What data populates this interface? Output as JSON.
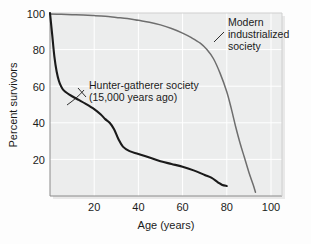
{
  "chart_data": {
    "type": "line",
    "title": "",
    "xlabel": "Age (years)",
    "ylabel": "Percent survivors",
    "xlim": [
      0,
      105
    ],
    "ylim": [
      0,
      100
    ],
    "xticks": [
      20,
      40,
      60,
      80,
      100
    ],
    "yticks": [
      20,
      40,
      60,
      80,
      100
    ],
    "grid": true,
    "legend_position": "annotations-on-plot",
    "series": [
      {
        "name": "Hunter-gatherer society (15,000 years ago)",
        "color": "#1a1a1a",
        "line_width": 2.1,
        "x": [
          0,
          1,
          2,
          3,
          4,
          5,
          6,
          8,
          10,
          13,
          16,
          20,
          23,
          25,
          27,
          29,
          31,
          33,
          36,
          40,
          45,
          50,
          55,
          60,
          65,
          70,
          73,
          76,
          78,
          80
        ],
        "y": [
          100,
          88,
          76,
          68,
          63,
          60,
          58,
          56,
          54.5,
          52.5,
          50.5,
          47.5,
          44.5,
          42,
          40,
          36.5,
          31,
          27,
          24.5,
          23,
          21,
          19,
          17.5,
          16,
          14,
          11.5,
          10,
          7.5,
          6,
          5.5
        ]
      },
      {
        "name": "Modern industrialized society",
        "color": "#6e6e6e",
        "line_width": 1.5,
        "x": [
          0,
          5,
          10,
          15,
          20,
          25,
          30,
          35,
          40,
          45,
          50,
          55,
          60,
          64,
          68,
          71,
          74,
          77,
          80,
          82,
          84,
          86,
          88,
          90,
          92,
          93
        ],
        "y": [
          99.5,
          99.3,
          99.1,
          98.9,
          98.6,
          98.2,
          97.6,
          97,
          96,
          95,
          93.5,
          91.5,
          89,
          86.5,
          83.5,
          80,
          75,
          67,
          57,
          48,
          38,
          29,
          21,
          13,
          6,
          2
        ]
      }
    ],
    "annotations": [
      {
        "name": "hunter-gatherer-label",
        "lines": [
          "Hunter-gatherer society",
          "(15,000 years ago)"
        ],
        "text": "Hunter-gatherer society (15,000 years ago)"
      },
      {
        "name": "modern-society-label",
        "lines": [
          "Modern",
          "industrialized",
          "society"
        ],
        "text": "Modern industrialized society"
      }
    ]
  },
  "colors": {
    "plot_background": "#eceded",
    "figure_background": "#fdfdfd",
    "gridline": "#ffffff",
    "axis_line": "#6e6e6e",
    "text": "#1b1b1b",
    "hunter_gatherer_curve": "#1a1a1a",
    "modern_curve": "#6e6e6e"
  },
  "axes": {
    "y_title": "Percent survivors",
    "x_title": "Age (years)",
    "y_tick_labels": [
      "100",
      "80",
      "60",
      "40",
      "20"
    ],
    "x_tick_labels": [
      "20",
      "40",
      "60",
      "80",
      "100"
    ]
  },
  "annotation_labels": {
    "hunter_line1": "Hunter-gatherer society",
    "hunter_line2": "(15,000 years ago)",
    "modern_line1": "Modern",
    "modern_line2": "industrialized",
    "modern_line3": "society"
  }
}
